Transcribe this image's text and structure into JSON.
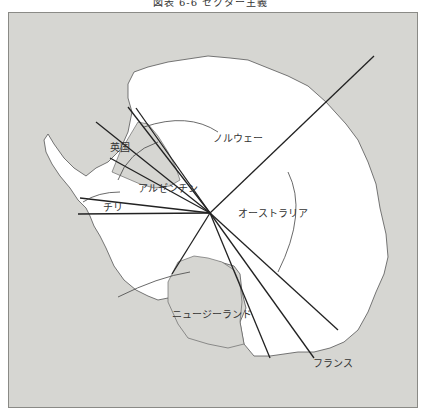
{
  "title": "図表 6-6 セクター主義",
  "map": {
    "region": "Antarctica",
    "center_point": {
      "x": 210,
      "y": 213
    },
    "colors": {
      "ocean": "#d6d6d2",
      "land": "#ffffff",
      "lines": "#222222",
      "frame": "#8a8a86"
    },
    "sector_labels": [
      {
        "key": "uk",
        "label": "英国"
      },
      {
        "key": "argentina",
        "label": "アルゼンチン"
      },
      {
        "key": "chile",
        "label": "チリ"
      },
      {
        "key": "norway",
        "label": "ノルウェー"
      },
      {
        "key": "australia",
        "label": "オーストラリア"
      },
      {
        "key": "new_zealand",
        "label": "ニュージーランド"
      },
      {
        "key": "france",
        "label": "フランス"
      }
    ]
  },
  "source": "（出所）…"
}
